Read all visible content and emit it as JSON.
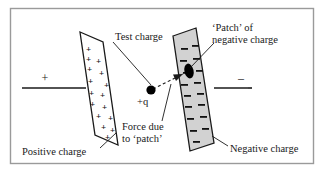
{
  "figure": {
    "border_color": "#9a9a9a",
    "background_color": "#ffffff",
    "ink_color": "#1a1a1a",
    "plate_fill_positive": "#ffffff",
    "plate_fill_negative": "#d2d2d2",
    "patch_color": "#000000",
    "labels": {
      "test_charge": "Test charge",
      "patch_line1": "‘Patch’ of",
      "patch_line2": "negative charge",
      "force_line1": "Force due",
      "force_line2": "to ‘patch’",
      "positive_charge": "Positive charge",
      "negative_charge": "Negative charge",
      "test_charge_symbol": "+q",
      "terminal_positive": "+",
      "terminal_negative": "–",
      "plate_positive_sign": "+",
      "plate_negative_sign": "–"
    }
  }
}
